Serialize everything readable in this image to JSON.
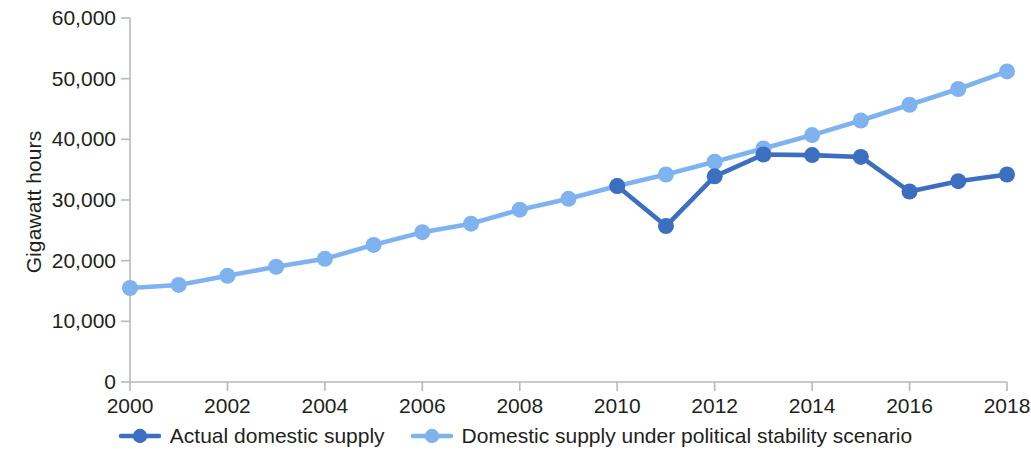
{
  "chart_data": {
    "type": "line",
    "title": "",
    "xlabel": "",
    "ylabel": "Gigawatt hours",
    "x": [
      2000,
      2001,
      2002,
      2003,
      2004,
      2005,
      2006,
      2007,
      2008,
      2009,
      2010,
      2011,
      2012,
      2013,
      2014,
      2015,
      2016,
      2017,
      2018
    ],
    "xlim": [
      2000,
      2018
    ],
    "ylim": [
      0,
      60000
    ],
    "grid": false,
    "legend_position": "bottom",
    "x_tick_labels": [
      "2000",
      "2002",
      "2004",
      "2006",
      "2008",
      "2010",
      "2012",
      "2014",
      "2016",
      "2018"
    ],
    "x_tick_values": [
      2000,
      2002,
      2004,
      2006,
      2008,
      2010,
      2012,
      2014,
      2016,
      2018
    ],
    "y_tick_labels": [
      "0",
      "10,000",
      "20,000",
      "30,000",
      "40,000",
      "50,000",
      "60,000"
    ],
    "y_tick_values": [
      0,
      10000,
      20000,
      30000,
      40000,
      50000,
      60000
    ],
    "series": [
      {
        "name": "Actual domestic supply",
        "color": "#3d6fc0",
        "x": [
          2010,
          2011,
          2012,
          2013,
          2014,
          2015,
          2016,
          2017,
          2018
        ],
        "values": [
          32300,
          25700,
          33900,
          37500,
          37400,
          37100,
          31400,
          33100,
          34200
        ]
      },
      {
        "name": "Domestic supply under political stability scenario",
        "color": "#7eb3ef",
        "x": [
          2000,
          2001,
          2002,
          2003,
          2004,
          2005,
          2006,
          2007,
          2008,
          2009,
          2010,
          2011,
          2012,
          2013,
          2014,
          2015,
          2016,
          2017,
          2018
        ],
        "values": [
          15500,
          16000,
          17500,
          19000,
          20300,
          22600,
          24700,
          26100,
          28400,
          30200,
          32300,
          34200,
          36300,
          38500,
          40700,
          43100,
          45700,
          48300,
          51200
        ]
      }
    ]
  },
  "axis": {
    "y_title": "Gigawatt hours"
  },
  "legend": {
    "items": [
      {
        "label": "Actual domestic supply",
        "color": "#3d6fc0"
      },
      {
        "label": "Domestic supply under political stability scenario",
        "color": "#7eb3ef"
      }
    ]
  }
}
